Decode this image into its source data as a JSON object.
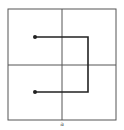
{
  "diagram": {
    "caption": "a",
    "grid": {
      "rows": 2,
      "cols": 2,
      "left": 8,
      "top": 9,
      "right": 116,
      "bottom": 120,
      "mid_x": 62,
      "mid_y": 65,
      "color": "#555555"
    },
    "path": {
      "start": {
        "x": 35,
        "y": 37
      },
      "corner1": {
        "x": 88,
        "y": 37
      },
      "corner2": {
        "x": 88,
        "y": 92
      },
      "end": {
        "x": 35,
        "y": 92
      },
      "color": "#222222"
    }
  }
}
